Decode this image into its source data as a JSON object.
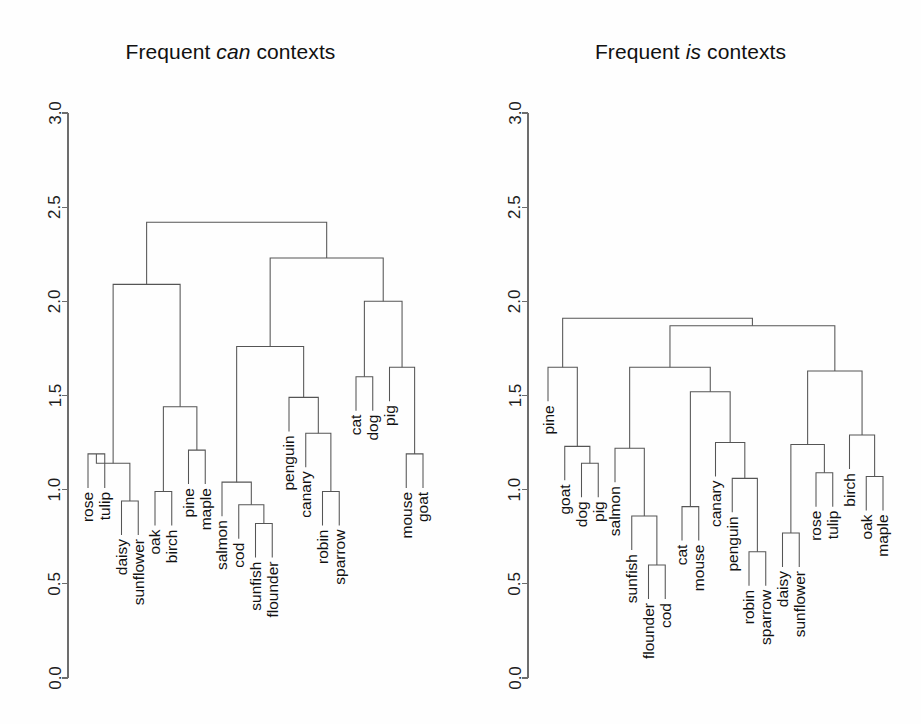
{
  "figure": {
    "background": "#fefefe",
    "line_color": "#555555",
    "axis_color": "#6d6d6d",
    "text_color": "#111111"
  },
  "panels": [
    {
      "id": "left",
      "title_prefix": "Frequent ",
      "title_emphasis": "can",
      "title_suffix": " contexts",
      "title_plain": "Frequent can contexts"
    },
    {
      "id": "right",
      "title_prefix": "Frequent ",
      "title_emphasis": "is",
      "title_suffix": " contexts",
      "title_plain": "Frequent is contexts"
    }
  ],
  "axis": {
    "ticks": [
      "3.0",
      "2.5",
      "2.0",
      "1.5",
      "1.0",
      "0.5",
      "0.0"
    ],
    "values": [
      3.0,
      2.5,
      2.0,
      1.5,
      1.0,
      0.5,
      0.0
    ],
    "min": 0.0,
    "max": 3.0,
    "orientation": "vertical-left",
    "label_rotation": -90
  },
  "chart_data": [
    {
      "type": "dendrogram",
      "title": "Frequent can contexts",
      "xlabel": "",
      "ylabel": "",
      "ylim": [
        0.0,
        3.0
      ],
      "grid": false,
      "legend": "none",
      "leaves": [
        "rose",
        "tulip",
        "daisy",
        "sunflower",
        "oak",
        "birch",
        "pine",
        "maple",
        "salmon",
        "cod",
        "sunfish",
        "flounder",
        "penguin",
        "canary",
        "robin",
        "sparrow",
        "cat",
        "dog",
        "pig",
        "mouse",
        "goat"
      ],
      "merges": [
        {
          "id": "m1",
          "left": "rose",
          "right": "tulip",
          "height": 1.19
        },
        {
          "id": "m2",
          "left": "daisy",
          "right": "sunflower",
          "height": 0.94
        },
        {
          "id": "m3",
          "left": "m1",
          "right": "m2",
          "height": 1.14
        },
        {
          "id": "m4",
          "left": "pine",
          "right": "maple",
          "height": 1.21
        },
        {
          "id": "m5",
          "left": "oak",
          "right": "birch",
          "height": 0.99
        },
        {
          "id": "m6",
          "left": "m5",
          "right": "m4",
          "height": 1.44
        },
        {
          "id": "m7",
          "left": "m3",
          "right": "m6",
          "height": 2.09
        },
        {
          "id": "m8",
          "left": "sunfish",
          "right": "flounder",
          "height": 0.82
        },
        {
          "id": "m9",
          "left": "cod",
          "right": "m8",
          "height": 0.92
        },
        {
          "id": "m10",
          "left": "salmon",
          "right": "m9",
          "height": 1.04
        },
        {
          "id": "m11",
          "left": "robin",
          "right": "sparrow",
          "height": 0.99
        },
        {
          "id": "m12",
          "left": "canary",
          "right": "m11",
          "height": 1.3
        },
        {
          "id": "m13",
          "left": "penguin",
          "right": "m12",
          "height": 1.49
        },
        {
          "id": "m14",
          "left": "m10",
          "right": "m13",
          "height": 1.76
        },
        {
          "id": "m15",
          "left": "cat",
          "right": "dog",
          "height": 1.6
        },
        {
          "id": "m16",
          "left": "mouse",
          "right": "goat",
          "height": 1.19
        },
        {
          "id": "m17",
          "left": "pig",
          "right": "m16",
          "height": 1.65
        },
        {
          "id": "m18",
          "left": "m15",
          "right": "m17",
          "height": 2.0
        },
        {
          "id": "m19",
          "left": "m14",
          "right": "m18",
          "height": 2.23
        },
        {
          "id": "m20",
          "left": "m7",
          "right": "m19",
          "height": 2.42
        }
      ]
    },
    {
      "type": "dendrogram",
      "title": "Frequent is contexts",
      "xlabel": "",
      "ylabel": "",
      "ylim": [
        0.0,
        3.0
      ],
      "grid": false,
      "legend": "none",
      "leaves": [
        "pine",
        "goat",
        "dog",
        "pig",
        "salmon",
        "sunfish",
        "flounder",
        "cod",
        "cat",
        "mouse",
        "canary",
        "penguin",
        "robin",
        "sparrow",
        "daisy",
        "sunflower",
        "rose",
        "tulip",
        "birch",
        "oak",
        "maple"
      ],
      "merges": [
        {
          "id": "n1",
          "left": "dog",
          "right": "pig",
          "height": 1.14
        },
        {
          "id": "n2",
          "left": "goat",
          "right": "n1",
          "height": 1.23
        },
        {
          "id": "n3",
          "left": "pine",
          "right": "n2",
          "height": 1.65
        },
        {
          "id": "n4",
          "left": "flounder",
          "right": "cod",
          "height": 0.6
        },
        {
          "id": "n5",
          "left": "sunfish",
          "right": "n4",
          "height": 0.86
        },
        {
          "id": "n6",
          "left": "salmon",
          "right": "n5",
          "height": 1.22
        },
        {
          "id": "n7",
          "left": "cat",
          "right": "mouse",
          "height": 0.91
        },
        {
          "id": "n8",
          "left": "robin",
          "right": "sparrow",
          "height": 0.67
        },
        {
          "id": "n9",
          "left": "penguin",
          "right": "n8",
          "height": 1.06
        },
        {
          "id": "n10",
          "left": "canary",
          "right": "n9",
          "height": 1.25
        },
        {
          "id": "n11",
          "left": "n7",
          "right": "n10",
          "height": 1.52
        },
        {
          "id": "n12",
          "left": "n6",
          "right": "n11",
          "height": 1.65
        },
        {
          "id": "n13",
          "left": "daisy",
          "right": "sunflower",
          "height": 0.77
        },
        {
          "id": "n14",
          "left": "rose",
          "right": "tulip",
          "height": 1.09
        },
        {
          "id": "n15",
          "left": "n13",
          "right": "n14",
          "height": 1.24
        },
        {
          "id": "n16",
          "left": "oak",
          "right": "maple",
          "height": 1.07
        },
        {
          "id": "n17",
          "left": "birch",
          "right": "n16",
          "height": 1.29
        },
        {
          "id": "n18",
          "left": "n15",
          "right": "n17",
          "height": 1.63
        },
        {
          "id": "n19",
          "left": "n12",
          "right": "n18",
          "height": 1.87
        },
        {
          "id": "n20",
          "left": "n3",
          "right": "n19",
          "height": 1.91
        }
      ]
    }
  ],
  "geometry": {
    "left_panel": {
      "axis_x": 68,
      "leaf_x0": 88,
      "leaf_step": 16.75,
      "y_top": 113,
      "y_bottom": 678
    },
    "right_panel": {
      "axis_x": 68,
      "leaf_x0": 88,
      "leaf_step": 16.75,
      "y_top": 113,
      "y_bottom": 678
    }
  }
}
